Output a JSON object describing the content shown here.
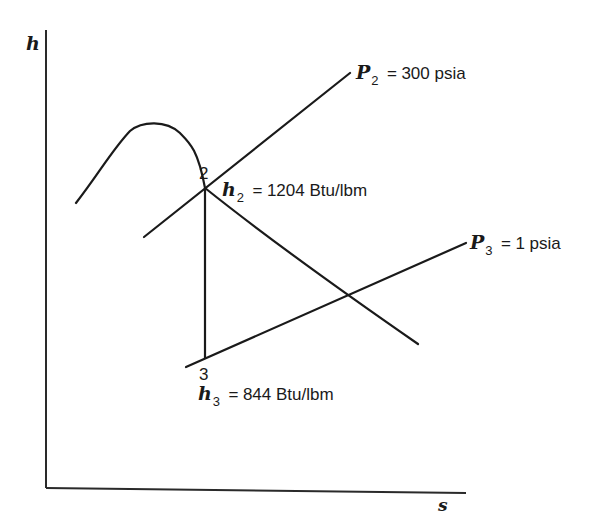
{
  "diagram": {
    "axes": {
      "y_label": "h",
      "x_label": "s"
    },
    "curves": {
      "saturation_dome": "saturation-dome",
      "isobar_p2": {
        "symbol": "P",
        "subscript": "2",
        "equals": "=",
        "value": "300 psia"
      },
      "isobar_p3": {
        "symbol": "P",
        "subscript": "3",
        "equals": "=",
        "value": "1 psia"
      }
    },
    "states": [
      {
        "id": "2",
        "label": "2",
        "enthalpy": {
          "symbol": "h",
          "subscript": "2",
          "equals": "=",
          "value": "1204 Btu/lbm"
        }
      },
      {
        "id": "3",
        "label": "3",
        "enthalpy": {
          "symbol": "h",
          "subscript": "3",
          "equals": "=",
          "value": "844 Btu/lbm"
        }
      }
    ],
    "colors": {
      "line": "#1a1a1a",
      "background": "#ffffff"
    }
  }
}
